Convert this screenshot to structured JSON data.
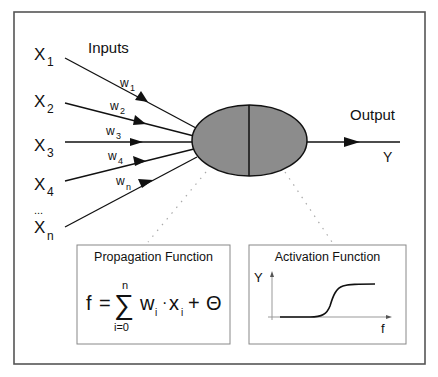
{
  "title_inputs": "Inputs",
  "title_output": "Output",
  "output_symbol": "Y",
  "inputs": [
    {
      "base": "X",
      "sub": "1",
      "weight_base": "w",
      "weight_sub": "1"
    },
    {
      "base": "X",
      "sub": "2",
      "weight_base": "w",
      "weight_sub": "2"
    },
    {
      "base": "X",
      "sub": "3",
      "weight_base": "w",
      "weight_sub": "3"
    },
    {
      "base": "X",
      "sub": "4",
      "weight_base": "w",
      "weight_sub": "4"
    },
    {
      "base": "X",
      "sub": "n",
      "weight_base": "w",
      "weight_sub": "n"
    }
  ],
  "ellipsis": "...",
  "propagation": {
    "title": "Propagation Function",
    "lhs": "f",
    "equals": "=",
    "sum_symbol": "∑",
    "sum_upper": "n",
    "sum_lower": "i=0",
    "term1_base": "w",
    "term1_sub": "i",
    "dot": "·",
    "term2_base": "x",
    "term2_sub": "i",
    "plus": "+",
    "bias": "Θ"
  },
  "activation": {
    "title": "Activation Function",
    "y_axis_label": "Y",
    "x_axis_label": "f"
  },
  "colors": {
    "neuron_fill": "#8c8c8c",
    "stroke": "#111111",
    "frame": "#555555",
    "box": "#888888",
    "dots": "#aaaaaa"
  }
}
